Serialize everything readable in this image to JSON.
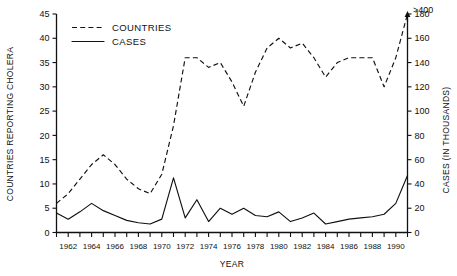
{
  "chart_data": {
    "type": "line",
    "title": "",
    "xlabel": "YEAR",
    "ylabel": "COUNTRIES REPORTING CHOLERA",
    "y2label": "CASES (IN THOUSANDS)",
    "xlim": [
      1961,
      1991
    ],
    "ylim": [
      0,
      45
    ],
    "y2lim": [
      0,
      180
    ],
    "grid": false,
    "legend_position": "top-left",
    "yticks": [
      0,
      5,
      10,
      15,
      20,
      25,
      30,
      35,
      40,
      45
    ],
    "y2ticks": [
      0,
      20,
      40,
      60,
      80,
      100,
      120,
      140,
      160,
      180
    ],
    "y2_break_label": ">400",
    "y2_axis_break": true,
    "xticks": [
      1961,
      1962,
      1963,
      1964,
      1965,
      1966,
      1967,
      1968,
      1969,
      1970,
      1971,
      1972,
      1973,
      1974,
      1975,
      1976,
      1977,
      1978,
      1979,
      1980,
      1981,
      1982,
      1983,
      1984,
      1985,
      1986,
      1987,
      1988,
      1989,
      1990,
      1991
    ],
    "xtick_labels": [
      "1962",
      "1964",
      "1966",
      "1968",
      "1970",
      "1972",
      "1974",
      "1976",
      "1978",
      "1980",
      "1982",
      "1984",
      "1986",
      "1988",
      "1990"
    ],
    "xtick_label_years": [
      1962,
      1964,
      1966,
      1968,
      1970,
      1972,
      1974,
      1976,
      1978,
      1980,
      1982,
      1984,
      1986,
      1988,
      1990
    ],
    "x": [
      1961,
      1962,
      1963,
      1964,
      1965,
      1966,
      1967,
      1968,
      1969,
      1970,
      1971,
      1972,
      1973,
      1974,
      1975,
      1976,
      1977,
      1978,
      1979,
      1980,
      1981,
      1982,
      1983,
      1984,
      1985,
      1986,
      1987,
      1988,
      1989,
      1990,
      1991
    ],
    "series": [
      {
        "name": "COUNTRIES",
        "axis": "left",
        "style": "dashed",
        "values": [
          6,
          8,
          11,
          14,
          16,
          14,
          11,
          9,
          8,
          12,
          22,
          36,
          36,
          34,
          35,
          31,
          26,
          33,
          38,
          40,
          38,
          39,
          36,
          32,
          35,
          36,
          36,
          36,
          30,
          36,
          45
        ]
      },
      {
        "name": "CASES",
        "axis": "right",
        "style": "solid",
        "values": [
          16,
          11,
          17,
          24,
          18,
          14,
          10,
          8,
          7,
          11,
          45,
          12,
          27,
          9,
          20,
          15,
          20,
          14,
          13,
          17,
          9,
          12,
          16,
          7,
          9,
          11,
          12,
          13,
          15,
          24,
          47
        ]
      }
    ],
    "legend": [
      {
        "label": "COUNTRIES",
        "style": "dashed"
      },
      {
        "label": "CASES",
        "style": "solid"
      }
    ],
    "annotations": [
      {
        "text": ">400",
        "note": "axis break above 180 on right axis"
      }
    ]
  }
}
